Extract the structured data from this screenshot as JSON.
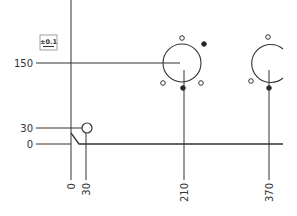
{
  "drawing": {
    "type": "ordinate-dimensioned mechanical drawing",
    "line_color": "#333333",
    "background": "#ffffff",
    "tolerance_box": {
      "text": "±0.1"
    },
    "y_ordinates": [
      {
        "label": "150"
      },
      {
        "label": "30"
      },
      {
        "label": "0"
      }
    ],
    "x_ordinates": [
      {
        "label": "0"
      },
      {
        "label": "30"
      },
      {
        "label": "210"
      },
      {
        "label": "370"
      }
    ],
    "features": [
      {
        "name": "small-hole",
        "x": "30",
        "y": "30"
      },
      {
        "name": "bolt-circle-1",
        "x": "210",
        "y": "150",
        "bolt_holes": 5,
        "filled_markers": 2
      },
      {
        "name": "bolt-circle-2",
        "x": "370",
        "y": "150",
        "partially_visible": true
      }
    ]
  }
}
